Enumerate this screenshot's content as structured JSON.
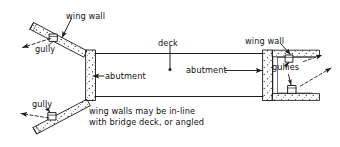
{
  "diagram": {
    "type": "engineering-plan-view",
    "stroke_color": "#1a1a1a",
    "fill_color": "#ffffff",
    "text_color": "#111111",
    "labels": {
      "wing_wall_top_left": "wing wall",
      "wing_wall_right": "wing wall",
      "gully_top_left": "gully",
      "gully_bottom_left": "gully",
      "gullies_right": "gullies",
      "abutment_left": "abutment",
      "abutment_right": "abutment",
      "deck": "deck",
      "note_line1": "wing walls may be in-line",
      "note_line2": "with bridge deck, or angled"
    },
    "elements": [
      {
        "name": "deck",
        "shape": "rectangle",
        "description": "central bridge deck spanning between abutments"
      },
      {
        "name": "abutment-left",
        "shape": "stippled-vertical-wall",
        "description": "left abutment wall"
      },
      {
        "name": "abutment-right",
        "shape": "stippled-vertical-wall",
        "description": "right abutment wall"
      },
      {
        "name": "wing-wall-upper-left",
        "shape": "angled-stippled-strip",
        "description": "splayed wing wall angled away from deck"
      },
      {
        "name": "wing-wall-lower-left",
        "shape": "angled-stippled-strip",
        "description": "splayed wing wall angled away from deck"
      },
      {
        "name": "wing-wall-upper-right",
        "shape": "in-line-stippled-strip",
        "description": "wing wall in-line with bridge deck"
      },
      {
        "name": "wing-wall-lower-right",
        "shape": "in-line-stippled-strip",
        "description": "wing wall in-line with bridge deck"
      },
      {
        "name": "gully-upper-left",
        "shape": "small-box",
        "description": "drainage gully on upper left wing wall"
      },
      {
        "name": "gully-lower-left",
        "shape": "small-box",
        "description": "drainage gully on lower left wing wall"
      },
      {
        "name": "gully-upper-right",
        "shape": "small-box",
        "description": "drainage gully on upper right wing wall"
      },
      {
        "name": "gully-lower-right",
        "shape": "small-box",
        "description": "drainage gully on lower right wing wall"
      }
    ],
    "flow_arrows": [
      {
        "name": "drainage-arrow-upper-left",
        "direction": "down-left"
      },
      {
        "name": "drainage-arrow-lower-left",
        "direction": "left"
      },
      {
        "name": "drainage-arrow-right",
        "direction": "up-right"
      }
    ]
  }
}
